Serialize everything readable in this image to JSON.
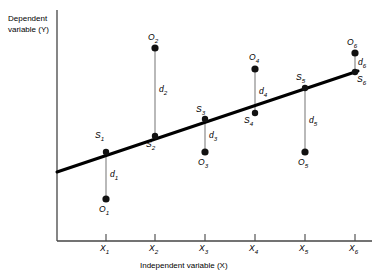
{
  "figure": {
    "y_axis_title_line1": "Dependent",
    "y_axis_title_line2": "variable (Y)",
    "x_axis_title": "Independent variable (X)"
  },
  "axis": {
    "x_ticks": [
      {
        "label": "X",
        "sub": "1",
        "x": 106
      },
      {
        "label": "X",
        "sub": "2",
        "x": 155
      },
      {
        "label": "X",
        "sub": "3",
        "x": 205
      },
      {
        "label": "X",
        "sub": "4",
        "x": 255
      },
      {
        "label": "X",
        "sub": "5",
        "x": 305
      },
      {
        "label": "X",
        "sub": "6",
        "x": 355
      }
    ]
  },
  "chart_data": {
    "type": "scatter",
    "title": "",
    "xlabel": "Independent variable (X)",
    "ylabel": "Dependent variable (Y)",
    "regression_line": {
      "x_start": 57,
      "y_start": 172,
      "x_end": 358,
      "y_end": 71
    },
    "points": [
      {
        "index": "1",
        "x_px": 106,
        "s_label": "S",
        "s_sub": "1",
        "s_y_px": 152,
        "o_label": "O",
        "o_sub": "1",
        "o_y_px": 199,
        "d_label": "d",
        "d_sub": "1",
        "residual_sign": "negative"
      },
      {
        "index": "2",
        "x_px": 155,
        "s_label": "S",
        "s_sub": "2",
        "s_y_px": 136,
        "o_label": "O",
        "o_sub": "2",
        "o_y_px": 48,
        "d_label": "d",
        "d_sub": "2",
        "residual_sign": "positive"
      },
      {
        "index": "3",
        "x_px": 205,
        "s_label": "S",
        "s_sub": "3",
        "s_y_px": 119,
        "o_label": "O",
        "o_sub": "3",
        "o_y_px": 152,
        "d_label": "d",
        "d_sub": "3",
        "residual_sign": "negative"
      },
      {
        "index": "4",
        "x_px": 255,
        "s_label": "S",
        "s_sub": "4",
        "s_y_px": 113,
        "o_label": "O",
        "o_sub": "4",
        "o_y_px": 69,
        "d_label": "d",
        "d_sub": "4",
        "residual_sign": "positive"
      },
      {
        "index": "5",
        "x_px": 305,
        "s_label": "S",
        "s_sub": "5",
        "s_y_px": 88,
        "o_label": "O",
        "o_sub": "5",
        "o_y_px": 152,
        "d_label": "d",
        "d_sub": "5",
        "residual_sign": "negative"
      },
      {
        "index": "6",
        "x_px": 355,
        "s_label": "S",
        "s_sub": "6",
        "s_y_px": 72,
        "o_label": "O",
        "o_sub": "6",
        "o_y_px": 53,
        "d_label": "d",
        "d_sub": "6",
        "residual_sign": "positive"
      }
    ],
    "colors": {
      "line": "#000000",
      "point": "#111111",
      "residual": "#8a8a8a",
      "axis": "#444444"
    },
    "grid": false,
    "legend": "none"
  },
  "labels": {
    "s1": {
      "t": "S",
      "s": "1",
      "x": 95,
      "y": 131
    },
    "s2": {
      "t": "S",
      "s": "2",
      "x": 146,
      "y": 140
    },
    "s3": {
      "t": "S",
      "s": "3",
      "x": 196,
      "y": 105
    },
    "s4": {
      "t": "S",
      "s": "4",
      "x": 244,
      "y": 116
    },
    "s5": {
      "t": "S",
      "s": "5",
      "x": 296,
      "y": 73
    },
    "s6": {
      "t": "S",
      "s": "6",
      "x": 357,
      "y": 75
    },
    "o1": {
      "t": "O",
      "s": "1",
      "x": 99,
      "y": 205
    },
    "o2": {
      "t": "O",
      "s": "2",
      "x": 148,
      "y": 33
    },
    "o3": {
      "t": "O",
      "s": "3",
      "x": 198,
      "y": 158
    },
    "o4": {
      "t": "O",
      "s": "4",
      "x": 249,
      "y": 53
    },
    "o5": {
      "t": "O",
      "s": "5",
      "x": 298,
      "y": 158
    },
    "o6": {
      "t": "O",
      "s": "6",
      "x": 347,
      "y": 38
    },
    "d1": {
      "t": "d",
      "s": "1",
      "x": 110,
      "y": 170
    },
    "d2": {
      "t": "d",
      "s": "2",
      "x": 159,
      "y": 85
    },
    "d3": {
      "t": "d",
      "s": "3",
      "x": 209,
      "y": 131
    },
    "d4": {
      "t": "d",
      "s": "4",
      "x": 259,
      "y": 87
    },
    "d5": {
      "t": "d",
      "s": "5",
      "x": 309,
      "y": 116
    },
    "d6": {
      "t": "d",
      "s": "6",
      "x": 358,
      "y": 58
    }
  }
}
